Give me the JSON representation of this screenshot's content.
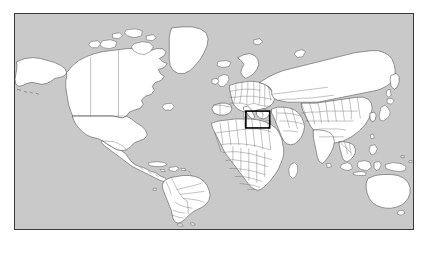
{
  "figure": {
    "type": "world-map",
    "projection_note": "equirectangular-style world map",
    "caption": "",
    "title": ""
  },
  "map": {
    "ocean_color": "#c9c9c9",
    "land_color": "#ffffff",
    "coastline_color": "#4a4a4a",
    "country_border_color": "#6a6a6a",
    "frame_color": "#3a3a3a",
    "background_color": "#ffffff",
    "frame": {
      "x": 14,
      "y": 13,
      "width": 400,
      "height": 217
    }
  },
  "highlight": {
    "label": "study-area-box",
    "region_name": "Eastern Mediterranean / Middle East",
    "color": "#000000",
    "stroke_width": 1.6,
    "box": {
      "x": 246,
      "y": 111,
      "width": 24,
      "height": 17
    }
  },
  "continents": [
    {
      "name": "North America"
    },
    {
      "name": "South America"
    },
    {
      "name": "Europe"
    },
    {
      "name": "Africa"
    },
    {
      "name": "Asia"
    },
    {
      "name": "Australia"
    }
  ],
  "legend": {
    "present": false,
    "entries": []
  },
  "annotations": [],
  "scale_bar": {
    "present": false
  },
  "graticule": {
    "present": false
  }
}
